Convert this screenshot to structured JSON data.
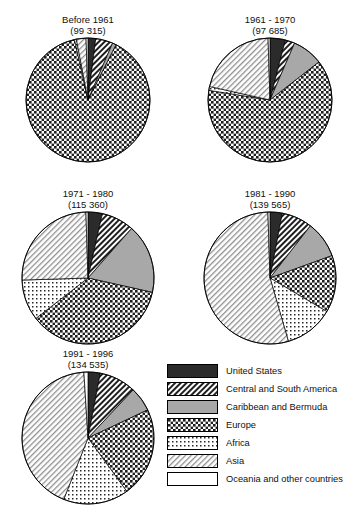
{
  "chart_data": {
    "type": "pie",
    "title": "",
    "legend_position": "bottom-right",
    "categories": [
      "United States",
      "Central and South America",
      "Caribbean and Bermuda",
      "Europe",
      "Africa",
      "Asia",
      "Oceania and other countries"
    ],
    "pattern_keys": [
      "us",
      "csa",
      "carib",
      "europe",
      "africa",
      "asia",
      "oceania"
    ],
    "charts": [
      {
        "title": "Before 1961",
        "subtitle": "(99 315)",
        "total": "99 315",
        "values": [
          2.0,
          4.5,
          1.0,
          89.0,
          0.5,
          2.5,
          0.5
        ]
      },
      {
        "title": "1961 - 1970",
        "subtitle": "(97 685)",
        "total": "97 685",
        "values": [
          4.0,
          2.5,
          8.0,
          63.0,
          1.0,
          21.0,
          0.5
        ]
      },
      {
        "title": "1971 - 1980",
        "subtitle": "(115 360)",
        "total": "115 360",
        "values": [
          3.5,
          8.0,
          17.0,
          36.0,
          10.0,
          25.0,
          0.5
        ]
      },
      {
        "title": "1981 - 1990",
        "subtitle": "(139 565)",
        "total": "139 565",
        "values": [
          3.0,
          7.5,
          9.0,
          14.0,
          12.0,
          54.0,
          0.5
        ]
      },
      {
        "title": "1991 - 1996",
        "subtitle": "(134 535)",
        "total": "134 535",
        "values": [
          3.0,
          9.0,
          6.0,
          22.0,
          16.0,
          43.0,
          1.0
        ]
      }
    ]
  },
  "legend": {
    "items": [
      {
        "label": "United States",
        "pattern": "us"
      },
      {
        "label": "Central and South America",
        "pattern": "csa"
      },
      {
        "label": "Caribbean and Bermuda",
        "pattern": "carib"
      },
      {
        "label": "Europe",
        "pattern": "europe"
      },
      {
        "label": "Africa",
        "pattern": "africa"
      },
      {
        "label": "Asia",
        "pattern": "asia"
      },
      {
        "label": "Oceania and other countries",
        "pattern": "oceania"
      }
    ]
  },
  "layout": {
    "cells": [
      {
        "left": 8,
        "top": 14,
        "width": 160,
        "radius": 62
      },
      {
        "left": 190,
        "top": 14,
        "width": 160,
        "radius": 62
      },
      {
        "left": 8,
        "top": 188,
        "width": 160,
        "radius": 66
      },
      {
        "left": 190,
        "top": 188,
        "width": 160,
        "radius": 66
      },
      {
        "left": 8,
        "top": 348,
        "width": 160,
        "radius": 66
      }
    ],
    "start_angle": -90
  }
}
